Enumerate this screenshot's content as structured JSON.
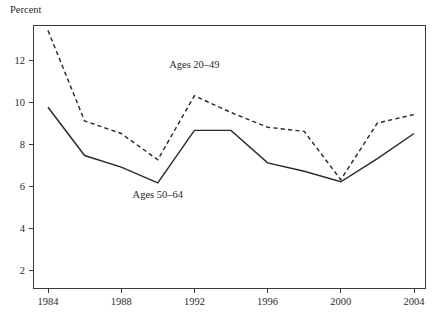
{
  "figure": {
    "background_color": "#ffffff",
    "line_color": "#2a2a2a",
    "axis_color": "#3a3a3a",
    "y_axis_title": "Percent"
  },
  "annotations": {
    "series_a_label": "Ages 20–49",
    "series_b_label": "Ages 50–64"
  },
  "chart_data": {
    "type": "line",
    "title": "",
    "subtitle": "",
    "xlabel": "",
    "ylabel": "Percent",
    "xlim": [
      1983,
      2005
    ],
    "ylim": [
      0,
      13.7
    ],
    "grid": false,
    "legend": "inline-annotations",
    "x": [
      1984,
      1986,
      1988,
      1990,
      1992,
      1994,
      1996,
      1998,
      2000,
      2002,
      2004
    ],
    "xticks": [
      1984,
      1988,
      1992,
      1996,
      2000,
      2004
    ],
    "xtick_labels": [
      "1984",
      "1988",
      "1992",
      "1996",
      "2000",
      "2004"
    ],
    "yticks": [
      2,
      4,
      6,
      8,
      10,
      12
    ],
    "ytick_labels": [
      "2",
      "4",
      "6",
      "8",
      "10",
      "12"
    ],
    "series": [
      {
        "name": "Ages 20–49",
        "style": "dashed",
        "label_x": 1992,
        "label_y": 11.6,
        "values": [
          13.4,
          9.1,
          8.5,
          7.25,
          10.3,
          9.5,
          8.8,
          8.6,
          6.3,
          9.0,
          9.4
        ]
      },
      {
        "name": "Ages 50–64",
        "style": "solid",
        "label_x": 1990,
        "label_y": 5.45,
        "values": [
          9.75,
          7.45,
          6.9,
          6.15,
          8.65,
          8.65,
          7.1,
          6.7,
          6.2,
          7.3,
          8.5
        ]
      }
    ]
  }
}
